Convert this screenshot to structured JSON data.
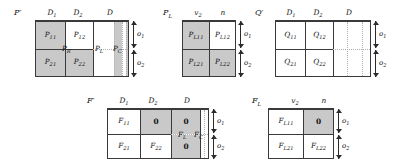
{
  "figure": {
    "caption": "",
    "colors": {
      "shaded": "#c9c9c9",
      "unshaded": "#ffffff",
      "border": "#3a3a3a",
      "dotted": "#b0b0b0"
    }
  },
  "matrices": [
    {
      "id": "P-prime",
      "name": "P′",
      "col_labels": [
        "D₁",
        "D₂",
        "D"
      ],
      "row_dims": [
        "o₁",
        "o₂"
      ],
      "cells": [
        {
          "label": "P₁₁",
          "shade": "gray"
        },
        {
          "label": "P₁₂",
          "shade": "white"
        },
        {
          "label": "P₂₁",
          "shade": "gray"
        },
        {
          "label": "P₂₂",
          "shade": "gray"
        }
      ],
      "region_labels": [
        "Pᵣ",
        "Pₗ",
        "Pꜱ"
      ]
    },
    {
      "id": "P-L",
      "name": "Pₗ",
      "col_labels": [
        "v₂",
        "n"
      ],
      "row_dims": [
        "o₁",
        "o₂"
      ],
      "cells": [
        {
          "label": "Pₗ₁₁",
          "shade": "gray"
        },
        {
          "label": "Pₗ₁₂",
          "shade": "white"
        },
        {
          "label": "Pₗ₂₁",
          "shade": "gray"
        },
        {
          "label": "Pₗ₂₂",
          "shade": "gray"
        }
      ],
      "region_labels": []
    },
    {
      "id": "Q-prime",
      "name": "Q′",
      "col_labels": [
        "D₁",
        "D₂",
        "D"
      ],
      "row_dims": [
        "o₁",
        "o₂"
      ],
      "cells": [
        {
          "label": "Q₁₁",
          "shade": "white"
        },
        {
          "label": "Q₁₂",
          "shade": "white"
        },
        {
          "label": "Q₂₁",
          "shade": "white"
        },
        {
          "label": "Q₂₂",
          "shade": "white"
        }
      ],
      "region_labels": []
    },
    {
      "id": "F-prime",
      "name": "F′",
      "col_labels": [
        "D₁",
        "D₂",
        "D"
      ],
      "row_dims": [
        "o₁",
        "o₂"
      ],
      "cells": [
        {
          "label": "F₁₁",
          "shade": "white"
        },
        {
          "label": "0",
          "shade": "gray"
        },
        {
          "label": "0",
          "shade": "gray"
        },
        {
          "label": "F₂₁",
          "shade": "white"
        },
        {
          "label": "F₂₂",
          "shade": "white"
        },
        {
          "label": "0",
          "shade": "gray"
        }
      ],
      "region_labels": [
        "Fₗ",
        "Fꜱ"
      ]
    },
    {
      "id": "F-L",
      "name": "Fₗ",
      "col_labels": [
        "v₂",
        "n"
      ],
      "row_dims": [
        "o₁",
        "o₂"
      ],
      "cells": [
        {
          "label": "Fₗ₁₁",
          "shade": "white"
        },
        {
          "label": "0",
          "shade": "gray"
        },
        {
          "label": "Fₗ₂₁",
          "shade": "white"
        },
        {
          "label": "Fₗ₂₂",
          "shade": "white"
        }
      ],
      "region_labels": []
    }
  ],
  "labels": {
    "P1_name": "P′",
    "P1_c1": "D",
    "P1_c1s": "1",
    "P1_c2": "D",
    "P1_c2s": "2",
    "P1_c3": "D",
    "P1_11": "P",
    "P1_11s": "11",
    "P1_12": "P",
    "P1_12s": "12",
    "P1_21": "P",
    "P1_21s": "21",
    "P1_22": "P",
    "P1_22s": "22",
    "P1_R": "P",
    "P1_Rs": "R",
    "P1_L": "P",
    "P1_Ls": "L",
    "P1_C": "P",
    "P1_Cs": "C",
    "P1_o1": "o",
    "P1_o1s": "1",
    "P1_o2": "o",
    "P1_o2s": "2",
    "P2_name": "P",
    "P2_names": "L",
    "P2_c1": "v",
    "P2_c1s": "2",
    "P2_c2": "n",
    "P2_11": "P",
    "P2_11s": "L11",
    "P2_12": "P",
    "P2_12s": "L12",
    "P2_21": "P",
    "P2_21s": "L21",
    "P2_22": "P",
    "P2_22s": "L22",
    "P2_o1": "o",
    "P2_o1s": "1",
    "P2_o2": "o",
    "P2_o2s": "2",
    "Q_name": "Q′",
    "Q_c1": "D",
    "Q_c1s": "1",
    "Q_c2": "D",
    "Q_c2s": "2",
    "Q_c3": "D",
    "Q_11": "Q",
    "Q_11s": "11",
    "Q_12": "Q",
    "Q_12s": "12",
    "Q_21": "Q",
    "Q_21s": "21",
    "Q_22": "Q",
    "Q_22s": "22",
    "Q_o1": "o",
    "Q_o1s": "1",
    "Q_o2": "o",
    "Q_o2s": "2",
    "F1_name": "F′",
    "F1_c1": "D",
    "F1_c1s": "1",
    "F1_c2": "D",
    "F1_c2s": "2",
    "F1_c3": "D",
    "F1_11": "F",
    "F1_11s": "11",
    "F1_12": "0",
    "F1_13": "0",
    "F1_21": "F",
    "F1_21s": "21",
    "F1_22": "F",
    "F1_22s": "22",
    "F1_23": "0",
    "F1_L": "F",
    "F1_Ls": "L",
    "F1_C": "F",
    "F1_Cs": "C",
    "F1_o1": "o",
    "F1_o1s": "1",
    "F1_o2": "o",
    "F1_o2s": "2",
    "F2_name": "F",
    "F2_names": "L",
    "F2_c1": "v",
    "F2_c1s": "2",
    "F2_c2": "n",
    "F2_11": "F",
    "F2_11s": "L11",
    "F2_12": "0",
    "F2_21": "F",
    "F2_21s": "L21",
    "F2_22": "F",
    "F2_22s": "L22",
    "F2_o1": "o",
    "F2_o1s": "1",
    "F2_o2": "o",
    "F2_o2s": "2"
  }
}
